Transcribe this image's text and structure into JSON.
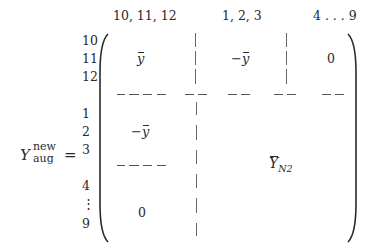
{
  "equation": {
    "lhs_symbol": "Y",
    "lhs_superscript": "new",
    "lhs_subscript": "aug",
    "equals": "="
  },
  "column_headers": [
    "10, 11, 12",
    "1, 2, 3",
    "4 . . . 9"
  ],
  "row_labels": [
    "10",
    "11",
    "12",
    "1",
    "2",
    "3",
    "4",
    "⋮",
    "9"
  ],
  "blocks": {
    "top_left": "y",
    "top_middle_sign": "−",
    "top_middle": "y",
    "top_right": "0",
    "middle_left_sign": "−",
    "middle_left": "y",
    "bottom_left": "0",
    "lower_right_symbol": "Y",
    "lower_right_subscript": "N2"
  }
}
